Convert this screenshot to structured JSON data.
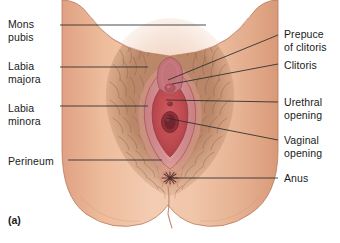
{
  "figure": {
    "caption": "(a)",
    "background_color": "#ffffff",
    "text_color": "#1a1a1a",
    "leader_line_color": "#2b2b2b"
  },
  "palette": {
    "skin_light": "#f2cdb2",
    "skin_mid": "#e8b08c",
    "skin_shadow": "#d99a78",
    "skin_edge": "#b9795a",
    "hair_brown": "#9d6a4e",
    "hair_dark": "#7d4f36",
    "labia_outer": "#d98f8f",
    "labia_pink": "#d2737a",
    "vestibule_red": "#c04c52",
    "vestibule_deep": "#a83b45",
    "clitoris_rose": "#c96b72",
    "anus_dark": "#5d3b34"
  },
  "labels": {
    "left": [
      {
        "id": "mons-pubis",
        "text": "Mons\npubis",
        "x": 8,
        "y": 18,
        "line": {
          "x1": 60,
          "y1": 25,
          "x2": 206,
          "y2": 25
        }
      },
      {
        "id": "labia-majora",
        "text": "Labia\nmajora",
        "x": 8,
        "y": 60,
        "line": {
          "x1": 60,
          "y1": 67,
          "x2": 148,
          "y2": 67
        }
      },
      {
        "id": "labia-minora",
        "text": "Labia\nminora",
        "x": 8,
        "y": 102,
        "line": {
          "x1": 60,
          "y1": 106,
          "x2": 148,
          "y2": 106
        }
      },
      {
        "id": "perineum",
        "text": "Perineum",
        "x": 8,
        "y": 155,
        "line": {
          "x1": 68,
          "y1": 160,
          "x2": 162,
          "y2": 160
        }
      }
    ],
    "right": [
      {
        "id": "prepuce-of-clitoris",
        "text": "Prepuce\nof clitoris",
        "x": 284,
        "y": 28,
        "line": {
          "x1": 278,
          "y1": 35,
          "x2": 168,
          "y2": 80
        }
      },
      {
        "id": "clitoris",
        "text": "Clitoris",
        "x": 284,
        "y": 59,
        "line": {
          "x1": 278,
          "y1": 64,
          "x2": 172,
          "y2": 84
        }
      },
      {
        "id": "urethral-opening",
        "text": "Urethral\nopening",
        "x": 284,
        "y": 96,
        "line": {
          "x1": 278,
          "y1": 102,
          "x2": 166,
          "y2": 100
        }
      },
      {
        "id": "vaginal-opening",
        "text": "Vaginal\nopening",
        "x": 284,
        "y": 134,
        "line": {
          "x1": 278,
          "y1": 140,
          "x2": 166,
          "y2": 118
        }
      },
      {
        "id": "anus",
        "text": "Anus",
        "x": 284,
        "y": 172,
        "line": {
          "x1": 278,
          "y1": 178,
          "x2": 172,
          "y2": 178
        }
      }
    ]
  },
  "anatomy": {
    "structures": [
      "mons pubis with pubic hair",
      "labia majora",
      "labia minora",
      "prepuce of clitoris",
      "clitoris",
      "urethral opening",
      "vaginal opening",
      "perineum",
      "anus",
      "thighs",
      "buttocks"
    ]
  }
}
